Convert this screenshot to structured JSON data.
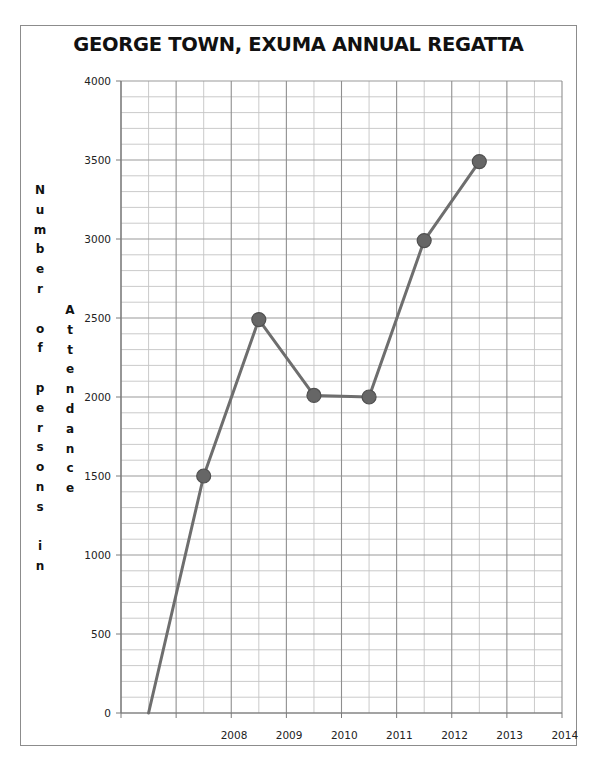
{
  "chart_data": {
    "type": "line",
    "title": "GEORGE TOWN, EXUMA ANNUAL REGATTA",
    "xlabel": "",
    "ylabel_primary": "Number of persons in",
    "ylabel_secondary": "Attendance",
    "categories": [
      "",
      "2008",
      "2009",
      "2010",
      "2011",
      "2012",
      "2013",
      "2014"
    ],
    "series": [
      {
        "name": "Attendance",
        "values": [
          0,
          1500,
          2490,
          2010,
          2000,
          2990,
          3490,
          null
        ],
        "color": "#6e6e6e",
        "marker_color": "#666666",
        "markers_on": [
          false,
          true,
          true,
          true,
          true,
          true,
          true,
          false
        ]
      }
    ],
    "ylim": [
      0,
      4000
    ],
    "yticks": [
      0,
      500,
      1000,
      1500,
      2000,
      2500,
      3000,
      3500,
      4000
    ],
    "y_minor_step": 100,
    "grid": true,
    "legend": "none"
  }
}
